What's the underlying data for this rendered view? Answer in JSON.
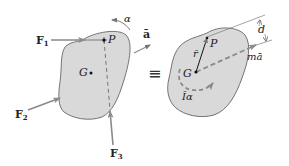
{
  "diagram": {
    "type": "rigid-body free-body / kinetic diagram equivalence",
    "colors": {
      "body_fill": "#d9d9d9",
      "body_outline": "#555555",
      "arrow": "#8a8a8a",
      "text": "#222222"
    },
    "left": {
      "forces": [
        {
          "label": "F",
          "sub": "1"
        },
        {
          "label": "F",
          "sub": "2"
        },
        {
          "label": "F",
          "sub": "3"
        }
      ],
      "point_P": "P",
      "point_G": "G",
      "angular_accel": "α",
      "accel": "ā"
    },
    "equivalence_symbol": "≡",
    "right": {
      "point_P": "P",
      "point_G": "G",
      "position_vector": "r̄",
      "distance": "d",
      "inertia_term": "mā",
      "moment_term": "Īα"
    }
  }
}
